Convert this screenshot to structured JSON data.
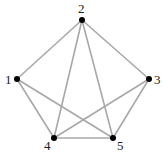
{
  "diagram": {
    "type": "graph",
    "edge_color": "#a8a8a8",
    "node_color": "#000000",
    "nodes": [
      {
        "id": "1",
        "label": "1",
        "x": 17,
        "y": 79,
        "lx": 5,
        "ly": 84
      },
      {
        "id": "2",
        "label": "2",
        "x": 82,
        "y": 20,
        "lx": 78,
        "ly": 13
      },
      {
        "id": "3",
        "label": "3",
        "x": 149,
        "y": 79,
        "lx": 154,
        "ly": 84
      },
      {
        "id": "4",
        "label": "4",
        "x": 54,
        "y": 138,
        "lx": 44,
        "ly": 150
      },
      {
        "id": "5",
        "label": "5",
        "x": 113,
        "y": 138,
        "lx": 117,
        "ly": 150
      }
    ],
    "edges": [
      [
        "1",
        "2"
      ],
      [
        "2",
        "3"
      ],
      [
        "2",
        "4"
      ],
      [
        "2",
        "5"
      ],
      [
        "1",
        "4"
      ],
      [
        "1",
        "5"
      ],
      [
        "3",
        "4"
      ],
      [
        "3",
        "5"
      ],
      [
        "4",
        "5"
      ]
    ]
  }
}
